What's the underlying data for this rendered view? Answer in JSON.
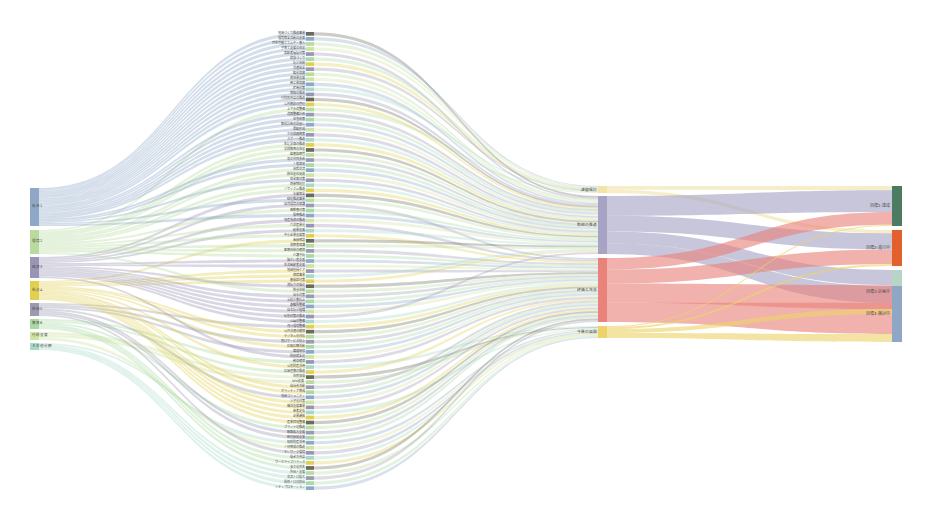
{
  "chart_data": {
    "type": "sankey",
    "title": "",
    "subtitle": "",
    "xlabel": "",
    "ylabel": "",
    "background": "#ffffff",
    "legend": "none",
    "grid": false,
    "columns": [
      {
        "index": 0,
        "name": "source-category",
        "x": 30,
        "width": 9
      },
      {
        "index": 1,
        "name": "detail-items",
        "x": 306,
        "width": 8
      },
      {
        "index": 2,
        "name": "group-stage",
        "x": 598,
        "width": 9
      },
      {
        "index": 3,
        "name": "outcome-category",
        "x": 892,
        "width": 10
      }
    ],
    "node_colors": {
      "blue": "#8fa8c8",
      "green": "#b9dba0",
      "purple": "#9b95b5",
      "yellow": "#e2cf52",
      "slate": "#9a9ab0",
      "mint": "#a9d9a4",
      "lime": "#cfe3a2",
      "teal": "#a8d9c8",
      "lavender": "#a6a3c4",
      "salmon": "#e8827a",
      "gold": "#edd46a",
      "cream": "#f0e4a8",
      "darkgreen": "#4c7a63",
      "orange": "#e2602c",
      "sage": "#b8d4c4",
      "steel": "#8fa6c4"
    },
    "nodes_left": [
      {
        "id": "L1",
        "label": "総合1",
        "value": 155,
        "color": "#8fa8c8",
        "y": 188,
        "h": 38
      },
      {
        "id": "L2",
        "label": "環境2",
        "value": 98,
        "color": "#b9dba0",
        "y": 230,
        "h": 24
      },
      {
        "id": "L3",
        "label": "経済3",
        "value": 86,
        "color": "#9b95b5",
        "y": 257,
        "h": 21
      },
      {
        "id": "L4",
        "label": "社会4",
        "value": 78,
        "color": "#e2cf52",
        "y": 281,
        "h": 19
      },
      {
        "id": "L5",
        "label": "技術5",
        "value": 53,
        "color": "#9a9ab0",
        "y": 303,
        "h": 13
      },
      {
        "id": "L6",
        "label": "教育6",
        "value": 41,
        "color": "#a9d9a4",
        "y": 319,
        "h": 10
      },
      {
        "id": "L7",
        "label": "行政支援",
        "value": 33,
        "color": "#cfe3a2",
        "y": 332,
        "h": 8
      },
      {
        "id": "L8",
        "label": "その他分野",
        "value": 29,
        "color": "#a8d9c8",
        "y": 343,
        "h": 7
      }
    ],
    "nodes_col3": [
      {
        "id": "C1",
        "label": "課題検討",
        "value": 28,
        "color": "#f0e4a8",
        "y": 186,
        "h": 7
      },
      {
        "id": "C2",
        "label": "取組の推進",
        "value": 118,
        "color": "#a6a3c4",
        "y": 196,
        "h": 58
      },
      {
        "id": "C3",
        "label": "評価と改善",
        "value": 140,
        "color": "#e8827a",
        "y": 258,
        "h": 64
      },
      {
        "id": "C4",
        "label": "今後の展開",
        "value": 42,
        "color": "#edd46a",
        "y": 326,
        "h": 12
      }
    ],
    "nodes_right": [
      {
        "id": "R1",
        "label": "目標1-達成",
        "value": 96,
        "color": "#4c7a63",
        "y": 186,
        "h": 40
      },
      {
        "id": "R2",
        "label": "目標2-進行中",
        "value": 88,
        "color": "#e2602c",
        "y": 230,
        "h": 36
      },
      {
        "id": "R3",
        "label": "目標3-計画中",
        "value": 74,
        "color": "#b8d4c4",
        "y": 270,
        "h": 44
      },
      {
        "id": "R4",
        "label": "目標4-検討中",
        "value": 70,
        "color": "#8fa6c4",
        "y": 286,
        "h": 56
      }
    ],
    "nodes_middle": [
      {
        "label": "地域づくり推進事業",
        "color": "#6b6b5e"
      },
      {
        "label": "環境保全活動の支援",
        "color": "#8fa8c8"
      },
      {
        "label": "再生可能エネルギー導入",
        "color": "#b9dba0"
      },
      {
        "label": "子育て支援の充実",
        "color": "#cfe3a2"
      },
      {
        "label": "高齢者福祉対策",
        "color": "#9b95b5"
      },
      {
        "label": "健康づくり",
        "color": "#a9d9a4"
      },
      {
        "label": "防災体制",
        "color": "#e2cf52"
      },
      {
        "label": "交通安全",
        "color": "#9a9ab0"
      },
      {
        "label": "観光振興",
        "color": "#b9dba0"
      },
      {
        "label": "農林業支援",
        "color": "#cfe3a2"
      },
      {
        "label": "商工業振興",
        "color": "#8fa8c8"
      },
      {
        "label": "雇用対策",
        "color": "#a8d9c8"
      },
      {
        "label": "情報化推進",
        "color": "#9b95b5"
      },
      {
        "label": "行財政改革の推進",
        "color": "#6b6b5e"
      },
      {
        "label": "公共施設の管理",
        "color": "#e2cf52"
      },
      {
        "label": "上下水道整備",
        "color": "#b9dba0"
      },
      {
        "label": "道路整備計画",
        "color": "#9a9ab0"
      },
      {
        "label": "住宅政策",
        "color": "#a9d9a4"
      },
      {
        "label": "都市計画の見直し",
        "color": "#8fa8c8"
      },
      {
        "label": "景観形成",
        "color": "#cfe3a2"
      },
      {
        "label": "文化振興施策",
        "color": "#9b95b5"
      },
      {
        "label": "スポーツ推進",
        "color": "#a8d9c8"
      },
      {
        "label": "生涯学習の推進",
        "color": "#e2cf52"
      },
      {
        "label": "学校教育の充実",
        "color": "#6b6b5e"
      },
      {
        "label": "図書館運営",
        "color": "#b9dba0"
      },
      {
        "label": "男女共同参画",
        "color": "#9a9ab0"
      },
      {
        "label": "人権啓発",
        "color": "#a9d9a4"
      },
      {
        "label": "国際交流",
        "color": "#8fa8c8"
      },
      {
        "label": "移住定住促進",
        "color": "#cfe3a2"
      },
      {
        "label": "空き家対策",
        "color": "#9b95b5"
      },
      {
        "label": "廃棄物処理",
        "color": "#a8d9c8"
      },
      {
        "label": "リサイクル推進",
        "color": "#e2cf52"
      },
      {
        "label": "水質保全",
        "color": "#6b6b5e"
      },
      {
        "label": "緑化推進事業",
        "color": "#b9dba0"
      },
      {
        "label": "自然環境の保護",
        "color": "#9a9ab0"
      },
      {
        "label": "鳥獣害対策",
        "color": "#a9d9a4"
      },
      {
        "label": "食育推進",
        "color": "#8fa8c8"
      },
      {
        "label": "地産地消の推進",
        "color": "#cfe3a2"
      },
      {
        "label": "六次産業化",
        "color": "#9b95b5"
      },
      {
        "label": "起業支援",
        "color": "#a8d9c8"
      },
      {
        "label": "中小企業支援策",
        "color": "#e2cf52"
      },
      {
        "label": "金融相談",
        "color": "#6b6b5e"
      },
      {
        "label": "消費者保護",
        "color": "#b9dba0"
      },
      {
        "label": "医療体制の確保",
        "color": "#9a9ab0"
      },
      {
        "label": "介護予防",
        "color": "#a9d9a4"
      },
      {
        "label": "障がい者支援",
        "color": "#8fa8c8"
      },
      {
        "label": "生活困窮者支援",
        "color": "#cfe3a2"
      },
      {
        "label": "地域包括ケア",
        "color": "#9b95b5"
      },
      {
        "label": "保健事業",
        "color": "#a8d9c8"
      },
      {
        "label": "感染症対策",
        "color": "#e2cf52"
      },
      {
        "label": "消防力の強化",
        "color": "#6b6b5e"
      },
      {
        "label": "救急体制",
        "color": "#b9dba0"
      },
      {
        "label": "治水対策",
        "color": "#9a9ab0"
      },
      {
        "label": "土砂災害防止",
        "color": "#a9d9a4"
      },
      {
        "label": "避難所整備",
        "color": "#8fa8c8"
      },
      {
        "label": "自主防災組織",
        "color": "#cfe3a2"
      },
      {
        "label": "防犯対策の推進",
        "color": "#9b95b5"
      },
      {
        "label": "公園の整備",
        "color": "#a8d9c8"
      },
      {
        "label": "河川環境整備",
        "color": "#e2cf52"
      },
      {
        "label": "公共交通の確保",
        "color": "#6b6b5e"
      },
      {
        "label": "デジタル化対応",
        "color": "#b9dba0"
      },
      {
        "label": "窓口サービス向上",
        "color": "#9a9ab0"
      },
      {
        "label": "広報広聴活動",
        "color": "#a9d9a4"
      },
      {
        "label": "職員研修",
        "color": "#8fa8c8"
      },
      {
        "label": "財政健全化",
        "color": "#cfe3a2"
      },
      {
        "label": "税収確保",
        "color": "#9b95b5"
      },
      {
        "label": "公有財産活用",
        "color": "#a8d9c8"
      },
      {
        "label": "広域連携の推進",
        "color": "#e2cf52"
      },
      {
        "label": "市民協働",
        "color": "#6b6b5e"
      },
      {
        "label": "NPO支援",
        "color": "#b9dba0"
      },
      {
        "label": "自治会活動",
        "color": "#9a9ab0"
      },
      {
        "label": "ボランティア育成",
        "color": "#a9d9a4"
      },
      {
        "label": "地域コミュニティ",
        "color": "#8fa8c8"
      },
      {
        "label": "少子化対策",
        "color": "#cfe3a2"
      },
      {
        "label": "婚活支援事業",
        "color": "#9b95b5"
      },
      {
        "label": "若者定着",
        "color": "#a8d9c8"
      },
      {
        "label": "企業誘致",
        "color": "#e2cf52"
      },
      {
        "label": "産業団地整備",
        "color": "#6b6b5e"
      },
      {
        "label": "ブランド化推進",
        "color": "#b9dba0"
      },
      {
        "label": "販路拡大支援",
        "color": "#9a9ab0"
      },
      {
        "label": "研究開発支援",
        "color": "#a9d9a4"
      },
      {
        "label": "知的財産活用",
        "color": "#8fa8c8"
      },
      {
        "label": "人材育成の推進",
        "color": "#cfe3a2"
      },
      {
        "label": "テレワーク環境",
        "color": "#9b95b5"
      },
      {
        "label": "働き方改革",
        "color": "#a8d9c8"
      },
      {
        "label": "ワークライフバランス",
        "color": "#e2cf52"
      },
      {
        "label": "多文化共生",
        "color": "#6b6b5e"
      },
      {
        "label": "外国人支援",
        "color": "#b9dba0"
      },
      {
        "label": "交流人口拡大",
        "color": "#9a9ab0"
      },
      {
        "label": "関係人口の創出",
        "color": "#a9d9a4"
      },
      {
        "label": "シティプロモーション",
        "color": "#8fa8c8"
      }
    ],
    "flow_opacity": 0.45,
    "flow_count_l_to_m": 92,
    "flow_count_m_to_c": 92,
    "flow_count_c_to_r": 14
  }
}
